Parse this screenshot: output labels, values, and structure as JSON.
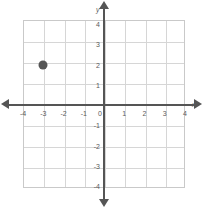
{
  "figure": {
    "type": "coordinate-plane",
    "title": "",
    "background_color": "#ffffff",
    "axis_color": "#555555",
    "grid_color": "#d6d6d6",
    "point_color": "#555555"
  },
  "axes": {
    "x_name": "x",
    "y_name": "y",
    "x_ticks": [
      "-4",
      "-3",
      "-2",
      "-1",
      "0",
      "1",
      "2",
      "3",
      "4"
    ],
    "y_ticks_positive": [
      "4",
      "3",
      "2",
      "1"
    ],
    "y_ticks_negative": [
      "-1",
      "-2",
      "-3",
      "-4"
    ],
    "origin_label": "0"
  },
  "chart_data": {
    "type": "scatter",
    "title": "",
    "xlabel": "x",
    "ylabel": "y",
    "xlim": [
      -4,
      4
    ],
    "ylim": [
      -4,
      4
    ],
    "xticks": [
      -4,
      -3,
      -2,
      -1,
      0,
      1,
      2,
      3,
      4
    ],
    "yticks": [
      -4,
      -3,
      -2,
      -1,
      0,
      1,
      2,
      3,
      4
    ],
    "grid": true,
    "legend": null,
    "series": [
      {
        "name": "plotted point",
        "marker": "filled-circle",
        "color": "#555555",
        "points": [
          {
            "x": -3,
            "y": 2,
            "label": "(-3, 2)"
          }
        ]
      }
    ]
  }
}
